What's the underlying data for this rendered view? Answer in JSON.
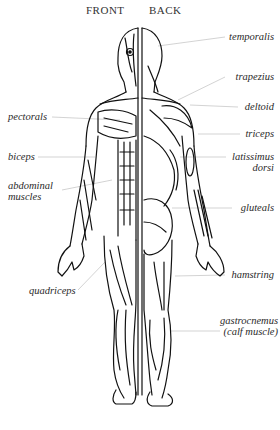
{
  "headings": {
    "front": "FRONT",
    "back": "BACK"
  },
  "labels": {
    "left": [
      {
        "id": "pectorals",
        "text": "pectorals"
      },
      {
        "id": "biceps",
        "text": "biceps"
      },
      {
        "id": "abdominal",
        "line1": "abdominal",
        "line2": "muscles"
      },
      {
        "id": "quadriceps",
        "text": "quadriceps"
      }
    ],
    "right": [
      {
        "id": "temporalis",
        "text": "temporalis"
      },
      {
        "id": "trapezius",
        "text": "trapezius"
      },
      {
        "id": "deltoid",
        "text": "deltoid"
      },
      {
        "id": "triceps",
        "text": "triceps"
      },
      {
        "id": "latissimus",
        "line1": "latissimus",
        "line2": "dorsi"
      },
      {
        "id": "gluteals",
        "text": "gluteals"
      },
      {
        "id": "hamstring",
        "text": "hamstring"
      },
      {
        "id": "gastrocnemus",
        "line1": "gastrocnemus",
        "line2": "(calf muscle)"
      }
    ]
  },
  "colors": {
    "ink": "#111111",
    "leader": "#c8c8c8",
    "label": "#2a2a2a"
  }
}
